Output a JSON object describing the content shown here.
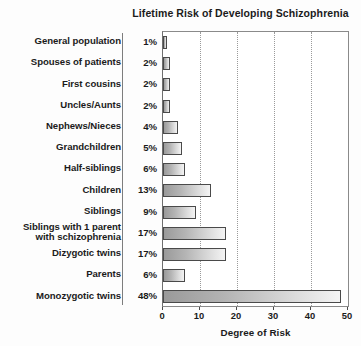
{
  "chart_data": {
    "type": "bar",
    "orientation": "horizontal",
    "title": "Lifetime Risk of Developing Schizophrenia",
    "xlabel": "Degree of Risk",
    "ylabel": "",
    "xlim": [
      0,
      50
    ],
    "xticks": [
      0,
      10,
      20,
      30,
      40,
      50
    ],
    "xtick_labels": [
      "0",
      "10",
      "20",
      "30",
      "40",
      "50"
    ],
    "gridlines": [
      10,
      20,
      30,
      40
    ],
    "grid": true,
    "legend": null,
    "categories": [
      "General population",
      "Spouses of patients",
      "First cousins",
      "Uncles/Aunts",
      "Nephews/Nieces",
      "Grandchildren",
      "Half-siblings",
      "Children",
      "Siblings",
      "Siblings with 1 parent with schizophrenia",
      "Dizygotic twins",
      "Parents",
      "Monozygotic twins"
    ],
    "values": [
      1,
      2,
      2,
      2,
      4,
      5,
      6,
      13,
      9,
      17,
      17,
      6,
      48
    ],
    "value_labels": [
      "1%",
      "2%",
      "2%",
      "2%",
      "4%",
      "5%",
      "6%",
      "13%",
      "9%",
      "17%",
      "17%",
      "6%",
      "48%"
    ]
  },
  "rows": [
    {
      "label": "General population",
      "label_line1": "General population",
      "label_line2": "",
      "pct": "1%",
      "value": 1
    },
    {
      "label": "Spouses of patients",
      "label_line1": "Spouses of patients",
      "label_line2": "",
      "pct": "2%",
      "value": 2
    },
    {
      "label": "First cousins",
      "label_line1": "First cousins",
      "label_line2": "",
      "pct": "2%",
      "value": 2
    },
    {
      "label": "Uncles/Aunts",
      "label_line1": "Uncles/Aunts",
      "label_line2": "",
      "pct": "2%",
      "value": 2
    },
    {
      "label": "Nephews/Nieces",
      "label_line1": "Nephews/Nieces",
      "label_line2": "",
      "pct": "4%",
      "value": 4
    },
    {
      "label": "Grandchildren",
      "label_line1": "Grandchildren",
      "label_line2": "",
      "pct": "5%",
      "value": 5
    },
    {
      "label": "Half-siblings",
      "label_line1": "Half-siblings",
      "label_line2": "",
      "pct": "6%",
      "value": 6
    },
    {
      "label": "Children",
      "label_line1": "Children",
      "label_line2": "",
      "pct": "13%",
      "value": 13
    },
    {
      "label": "Siblings",
      "label_line1": "Siblings",
      "label_line2": "",
      "pct": "9%",
      "value": 9
    },
    {
      "label": "Siblings with 1 parent with schizophrenia",
      "label_line1": "Siblings with 1 parent",
      "label_line2": "with schizophrenia",
      "pct": "17%",
      "value": 17
    },
    {
      "label": "Dizygotic twins",
      "label_line1": "Dizygotic twins",
      "label_line2": "",
      "pct": "17%",
      "value": 17
    },
    {
      "label": "Parents",
      "label_line1": "Parents",
      "label_line2": "",
      "pct": "6%",
      "value": 6
    },
    {
      "label": "Monozygotic twins",
      "label_line1": "Monozygotic twins",
      "label_line2": "",
      "pct": "48%",
      "value": 48
    }
  ],
  "axis": {
    "title": "Degree of Risk",
    "ticks": [
      "0",
      "10",
      "20",
      "30",
      "40",
      "50"
    ]
  },
  "colors": {
    "bar_dark": "#9a9a9a",
    "bar_light": "#f4f4f4",
    "bar_border": "#4a4a4a",
    "plot_border": "#8a8a8a",
    "gridline": "#9a9a9a",
    "text": "#1b1b1b",
    "background": "#ffffff"
  }
}
